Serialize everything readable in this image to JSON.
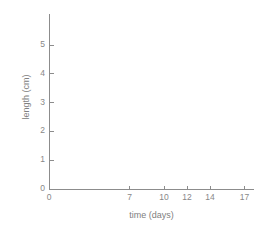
{
  "chart_data": {
    "type": "scatter",
    "title": "",
    "subtitle": "",
    "xlabel": "time (days)",
    "ylabel": "length (cm)",
    "x_tick_labels": [
      "0",
      "7",
      "10",
      "12",
      "14",
      "17"
    ],
    "x_tick_values": [
      0,
      7,
      10,
      12,
      14,
      17
    ],
    "y_tick_labels": [
      "0",
      "1",
      "2",
      "3",
      "4",
      "5"
    ],
    "y_tick_values": [
      0,
      1,
      2,
      3,
      4,
      5
    ],
    "xlim": [
      0,
      17.8
    ],
    "ylim": [
      0,
      6.1
    ],
    "grid": false,
    "legend": false,
    "legend_position": "none",
    "series": [],
    "values": [],
    "categories": [],
    "annotations": [],
    "note": "Empty axes template: no data points, bars or lines are plotted inside the axes."
  },
  "chart": {
    "axis_color": "#8c8c8c",
    "tick_color": "#8c8c8c",
    "label_color": "#888888",
    "title_color": "#808080",
    "background": "#ffffff"
  },
  "axes": {
    "x_title": "time (days)",
    "y_title": "length (cm)",
    "x_ticks": [
      {
        "label": "0",
        "value": 0
      },
      {
        "label": "7",
        "value": 7
      },
      {
        "label": "10",
        "value": 10
      },
      {
        "label": "12",
        "value": 12
      },
      {
        "label": "14",
        "value": 14
      },
      {
        "label": "17",
        "value": 17
      }
    ],
    "y_ticks": [
      {
        "label": "0",
        "value": 0
      },
      {
        "label": "1",
        "value": 1
      },
      {
        "label": "2",
        "value": 2
      },
      {
        "label": "3",
        "value": 3
      },
      {
        "label": "4",
        "value": 4
      },
      {
        "label": "5",
        "value": 5
      }
    ]
  }
}
